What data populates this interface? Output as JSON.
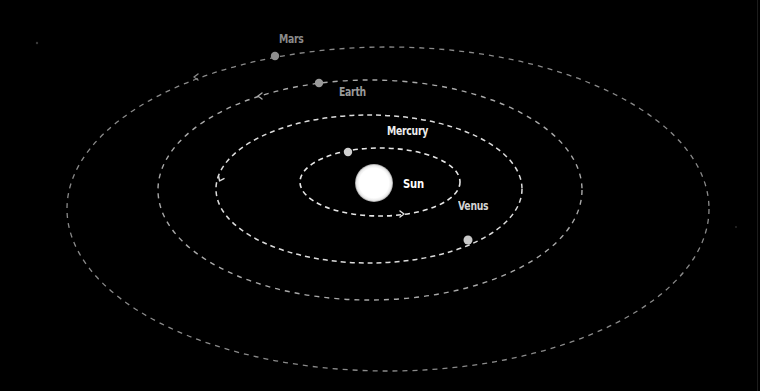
{
  "diagram": {
    "background": "#000000",
    "sun": {
      "label": "Sun",
      "cx": 374,
      "cy": 183,
      "r": 19,
      "color": "#ffffff",
      "label_x": 403,
      "label_y": 176,
      "label_color": "#ffffff"
    },
    "orbits": [
      {
        "name": "Mercury",
        "cx": 380,
        "cy": 182,
        "rx": 80,
        "ry": 34,
        "stroke": "#e6e6e6",
        "dash": "5 4",
        "width": 1.6,
        "planet": {
          "x": 348,
          "y": 152,
          "r": 4.2,
          "color": "#cfcfcf"
        },
        "label": "Mercury",
        "label_x": 387,
        "label_y": 124,
        "label_color": "#ededed",
        "arrow": {
          "x": 403,
          "y": 214,
          "direction": "right"
        }
      },
      {
        "name": "Venus",
        "cx": 369,
        "cy": 189,
        "rx": 153,
        "ry": 74,
        "stroke": "#dcdcdc",
        "dash": "5 4",
        "width": 1.5,
        "planet": {
          "x": 468,
          "y": 240,
          "r": 4.5,
          "color": "#c8c8c8"
        },
        "label": "Venus",
        "label_x": 458,
        "label_y": 199,
        "label_color": "#d4d4d4",
        "arrow": {
          "x": 220,
          "y": 180,
          "direction": "down-left"
        }
      },
      {
        "name": "Earth",
        "cx": 370,
        "cy": 190,
        "rx": 212,
        "ry": 110,
        "stroke": "#a8a8a8",
        "dash": "5 5",
        "width": 1.4,
        "planet": {
          "x": 319,
          "y": 83,
          "r": 4.2,
          "color": "#9a9a9a"
        },
        "label": "Earth",
        "label_x": 339,
        "label_y": 85,
        "label_color": "#9a9a9a",
        "arrow": {
          "x": 259,
          "y": 96,
          "direction": "left"
        }
      },
      {
        "name": "Mars",
        "cx": 388,
        "cy": 209,
        "rx": 321,
        "ry": 162,
        "stroke": "#8a8a8a",
        "dash": "5 5",
        "width": 1.3,
        "planet": {
          "x": 275,
          "y": 56,
          "r": 4.2,
          "color": "#8e8e8e"
        },
        "label": "Mars",
        "label_x": 279,
        "label_y": 32,
        "label_color": "#8a8a8a",
        "arrow": {
          "x": 195,
          "y": 77,
          "direction": "left"
        }
      }
    ],
    "stars": [
      {
        "x": 37,
        "y": 43,
        "r": 1.2,
        "color": "#3a3a3a"
      },
      {
        "x": 736,
        "y": 227,
        "r": 0.9,
        "color": "#2e2e2e"
      }
    ]
  }
}
